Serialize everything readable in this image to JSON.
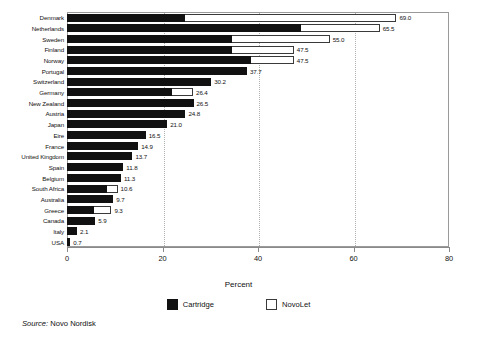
{
  "chart_data": {
    "type": "bar",
    "orientation": "horizontal",
    "stacked": true,
    "title": "",
    "xlabel": "Percent",
    "ylabel": "",
    "xlim": [
      0,
      80
    ],
    "xticks": [
      0,
      20,
      40,
      60,
      80
    ],
    "xtick_labels": [
      "0",
      "20",
      "40",
      "60",
      "80"
    ],
    "grid": "vertical dotted gridlines at 20, 40, 60",
    "legend_position": "bottom-center",
    "categories": [
      "Denmark",
      "Netherlands",
      "Sweden",
      "Finland",
      "Norway",
      "Portugal",
      "Switzerland",
      "Germany",
      "New Zealand",
      "Austria",
      "Japan",
      "Eire",
      "France",
      "United Kingdom",
      "Spain",
      "Belgium",
      "South Africa",
      "Australia",
      "Greece",
      "Canada",
      "Italy",
      "USA"
    ],
    "series": [
      {
        "name": "Cartridge",
        "color": "#111111",
        "values": [
          24.8,
          49.0,
          34.5,
          34.5,
          38.5,
          37.7,
          30.2,
          22.0,
          26.5,
          24.8,
          21.0,
          16.5,
          14.9,
          13.7,
          11.8,
          11.3,
          8.3,
          9.7,
          5.7,
          5.9,
          2.1,
          0.7
        ]
      },
      {
        "name": "NovoLet",
        "color": "#ffffff",
        "values": [
          44.2,
          16.5,
          20.5,
          13.0,
          9.0,
          0.0,
          0.0,
          4.4,
          0.0,
          0.0,
          0.0,
          0.0,
          0.0,
          0.0,
          0.0,
          0.0,
          2.3,
          0.0,
          3.6,
          0.0,
          0.0,
          0.0
        ]
      }
    ],
    "totals": [
      69.0,
      65.5,
      55.0,
      47.5,
      47.5,
      37.7,
      30.2,
      26.4,
      26.5,
      24.8,
      21.0,
      16.5,
      14.9,
      13.7,
      11.8,
      11.3,
      10.6,
      9.7,
      9.3,
      5.9,
      2.1,
      0.7
    ],
    "total_labels": [
      "69.0",
      "65.5",
      "55.0",
      "47.5",
      "47.5",
      "37.7",
      "30.2",
      "26.4",
      "26.5",
      "24.8",
      "21.0",
      "16.5",
      "14.9",
      "13.7",
      "11.8",
      "11.3",
      "10.6",
      "9.7",
      "9.3",
      "5.9",
      "2.1",
      "0.7"
    ]
  },
  "legend": {
    "items": [
      {
        "label": "Cartridge",
        "swatch": "filled-black-swatch"
      },
      {
        "label": "NovoLet",
        "swatch": "outline-white-swatch"
      }
    ]
  },
  "axis": {
    "x_title": "Percent"
  },
  "source": {
    "prefix": "Source:",
    "text": "Novo Nordisk"
  }
}
